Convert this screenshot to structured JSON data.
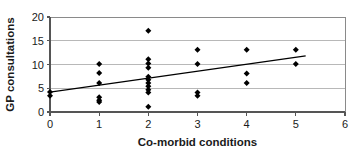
{
  "chart_data": {
    "type": "scatter",
    "title": "",
    "xlabel": "Co-morbid conditions",
    "ylabel": "GP consultations",
    "xlim": [
      0,
      6
    ],
    "ylim": [
      0,
      20
    ],
    "xticks": [
      "0",
      "1",
      "2",
      "3",
      "4",
      "5",
      "6"
    ],
    "yticks": [
      "0",
      "5",
      "10",
      "15",
      "20"
    ],
    "xtick_values": [
      0,
      1,
      2,
      3,
      4,
      5,
      6
    ],
    "ytick_values": [
      0,
      5,
      10,
      15,
      20
    ],
    "grid": "horizontal",
    "legend": "none",
    "marker": "diamond",
    "marker_color": "#000000",
    "points": [
      {
        "x": 0,
        "y": 4.2
      },
      {
        "x": 0,
        "y": 3.4
      },
      {
        "x": 1,
        "y": 10.1
      },
      {
        "x": 1,
        "y": 8.2
      },
      {
        "x": 1,
        "y": 6.1
      },
      {
        "x": 1,
        "y": 3.1
      },
      {
        "x": 1,
        "y": 2.5
      },
      {
        "x": 1,
        "y": 2.1
      },
      {
        "x": 2,
        "y": 17.1
      },
      {
        "x": 2,
        "y": 11.1
      },
      {
        "x": 2,
        "y": 10.2
      },
      {
        "x": 2,
        "y": 9.3
      },
      {
        "x": 2,
        "y": 7.4
      },
      {
        "x": 2,
        "y": 6.8
      },
      {
        "x": 2,
        "y": 6.1
      },
      {
        "x": 2,
        "y": 5.4
      },
      {
        "x": 2,
        "y": 4.7
      },
      {
        "x": 2,
        "y": 4.1
      },
      {
        "x": 2,
        "y": 1.1
      },
      {
        "x": 3,
        "y": 13.1
      },
      {
        "x": 3,
        "y": 10.1
      },
      {
        "x": 3,
        "y": 4.1
      },
      {
        "x": 3,
        "y": 3.4
      },
      {
        "x": 4,
        "y": 13.1
      },
      {
        "x": 4,
        "y": 8.1
      },
      {
        "x": 4,
        "y": 6.1
      },
      {
        "x": 5,
        "y": 13.1
      },
      {
        "x": 5,
        "y": 10.1
      }
    ],
    "trendline": {
      "type": "linear",
      "x_start": 0,
      "y_start": 4.2,
      "x_end": 5.2,
      "y_end": 11.8,
      "color": "#000000"
    },
    "colors": {
      "axis": "#555555",
      "grid": "#b8b8b8",
      "frame": "#8a8a8a",
      "text": "#1a1a1a",
      "background": "#ffffff"
    }
  }
}
